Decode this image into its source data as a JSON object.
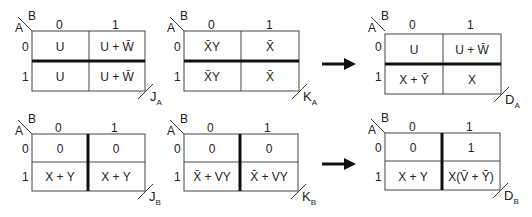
{
  "diagram": {
    "title": "",
    "maps": [
      {
        "id": "JA",
        "label_main": "J",
        "label_sub": "A",
        "row_var": "A",
        "col_var": "B",
        "col_headers": [
          "0",
          "1"
        ],
        "row_headers": [
          "0",
          "1"
        ],
        "cells": [
          [
            "U",
            "U + W̄"
          ],
          [
            "U",
            "U + W̄"
          ]
        ],
        "thick_divider": "horizontal"
      },
      {
        "id": "KA",
        "label_main": "K",
        "label_sub": "A",
        "row_var": "A",
        "col_var": "B",
        "col_headers": [
          "0",
          "1"
        ],
        "row_headers": [
          "0",
          "1"
        ],
        "cells": [
          [
            "X̄Y",
            "X̄"
          ],
          [
            "X̄Y",
            "X̄"
          ]
        ],
        "thick_divider": "horizontal"
      },
      {
        "id": "DA",
        "label_main": "D",
        "label_sub": "A",
        "row_var": "A",
        "col_var": "B",
        "col_headers": [
          "0",
          "1"
        ],
        "row_headers": [
          "0",
          "1"
        ],
        "cells": [
          [
            "U",
            "U + W̄"
          ],
          [
            "X + Ȳ",
            "X"
          ]
        ],
        "thick_divider": "horizontal"
      },
      {
        "id": "JB",
        "label_main": "J",
        "label_sub": "B",
        "row_var": "A",
        "col_var": "B",
        "col_headers": [
          "0",
          "1"
        ],
        "row_headers": [
          "0",
          "1"
        ],
        "cells": [
          [
            "0",
            "0"
          ],
          [
            "X + Y",
            "X + Y"
          ]
        ],
        "thick_divider": "vertical"
      },
      {
        "id": "KB",
        "label_main": "K",
        "label_sub": "B",
        "row_var": "A",
        "col_var": "B",
        "col_headers": [
          "0",
          "1"
        ],
        "row_headers": [
          "0",
          "1"
        ],
        "cells": [
          [
            "0",
            "0"
          ],
          [
            "X̄ + VY",
            "X̄ + VY"
          ]
        ],
        "thick_divider": "vertical"
      },
      {
        "id": "DB",
        "label_main": "D",
        "label_sub": "B",
        "row_var": "A",
        "col_var": "B",
        "col_headers": [
          "0",
          "1"
        ],
        "row_headers": [
          "0",
          "1"
        ],
        "cells": [
          [
            "0",
            "1"
          ],
          [
            "X + Y",
            "X(V̄ + Ȳ)"
          ]
        ],
        "thick_divider": "vertical"
      }
    ],
    "arrows": [
      {
        "from": "KA",
        "to": "DA",
        "direction": "right"
      },
      {
        "from": "KB",
        "to": "DB",
        "direction": "right"
      }
    ]
  }
}
